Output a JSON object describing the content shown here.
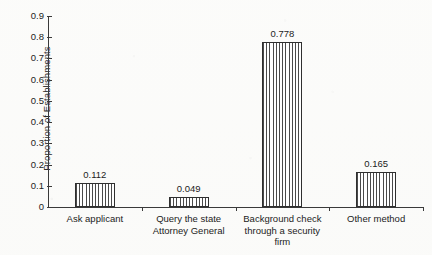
{
  "chart_data": {
    "type": "bar",
    "title": "",
    "subtitle": "",
    "xlabel": "",
    "ylabel": "Proportion of Establishments",
    "ylim": [
      0,
      0.9
    ],
    "grid": false,
    "legend": null,
    "ytick_labels": [
      "0",
      "0.1",
      "0.2",
      "0.3",
      "0.4",
      "0.5",
      "0.6",
      "0.7",
      "0.8",
      "0.9"
    ],
    "ytick_values": [
      0,
      0.1,
      0.2,
      0.3,
      0.4,
      0.5,
      0.6,
      0.7,
      0.8,
      0.9
    ],
    "categories": [
      "Ask applicant",
      "Query the state Attorney General",
      "Background check through a security firm",
      "Other method"
    ],
    "category_lines": [
      [
        "Ask applicant"
      ],
      [
        "Query the state",
        "Attorney General"
      ],
      [
        "Background check",
        "through a security",
        "firm"
      ],
      [
        "Other method"
      ]
    ],
    "values": [
      0.112,
      0.049,
      0.778,
      0.165
    ],
    "value_labels": [
      "0.112",
      "0.049",
      "0.778",
      "0.165"
    ],
    "bar_fill": "vertical-hatch",
    "bar_edge_color": "#2f2f2f",
    "bar_hatch_color": "#4a4a4a",
    "axis_color": "#3a3a3a",
    "background_color": "#fdfdfc"
  }
}
